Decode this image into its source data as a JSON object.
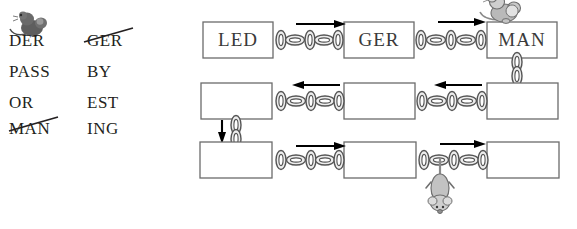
{
  "word_list": {
    "column_left": [
      {
        "text": "DER",
        "struck": false
      },
      {
        "text": "PASS",
        "struck": false
      },
      {
        "text": "OR",
        "struck": false
      },
      {
        "text": "MAN",
        "struck": true
      }
    ],
    "column_right": [
      {
        "text": "GER",
        "struck": true
      },
      {
        "text": "BY",
        "struck": false
      },
      {
        "text": "EST",
        "struck": false
      },
      {
        "text": "ING",
        "struck": false
      }
    ]
  },
  "diagram": {
    "rows": [
      {
        "name": "row-top",
        "boxes": [
          {
            "label": "LED",
            "filled": true
          },
          {
            "label": "GER",
            "filled": true
          },
          {
            "label": "MAN",
            "filled": true
          }
        ],
        "arrow_direction": "right"
      },
      {
        "name": "row-middle",
        "boxes": [
          {
            "label": "",
            "filled": false
          },
          {
            "label": "",
            "filled": false
          },
          {
            "label": "",
            "filled": false
          }
        ],
        "arrow_direction": "left"
      },
      {
        "name": "row-bottom",
        "boxes": [
          {
            "label": "",
            "filled": false
          },
          {
            "label": "",
            "filled": false
          },
          {
            "label": "",
            "filled": false
          }
        ],
        "arrow_direction": "right"
      }
    ],
    "connectors": [
      {
        "name": "chain-top-1",
        "orientation": "horizontal"
      },
      {
        "name": "chain-top-2",
        "orientation": "horizontal"
      },
      {
        "name": "chain-man-down",
        "orientation": "vertical"
      },
      {
        "name": "chain-middle-1",
        "orientation": "horizontal"
      },
      {
        "name": "chain-middle-2",
        "orientation": "horizontal"
      },
      {
        "name": "chain-left-down",
        "orientation": "vertical"
      },
      {
        "name": "chain-bottom-1",
        "orientation": "horizontal"
      },
      {
        "name": "chain-bottom-2",
        "orientation": "horizontal"
      }
    ],
    "mice": [
      {
        "name": "mouse-on-man-box",
        "pose": "sitting"
      },
      {
        "name": "mouse-hanging-from-chain",
        "pose": "hanging"
      },
      {
        "name": "mouse-above-der",
        "pose": "sitting"
      }
    ]
  },
  "colors": {
    "ink": "#231f20",
    "box_stroke": "#6b6b6b",
    "box_text": "#3a3a3a",
    "chain_stroke": "#555555",
    "chain_fill": "#e8e8e8",
    "mouse_dark": "#575757",
    "mouse_light": "#b8b8b8"
  }
}
